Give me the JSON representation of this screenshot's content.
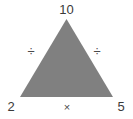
{
  "diagram": {
    "type": "number-triangle-puzzle",
    "shape": {
      "name": "triangle",
      "fill_color": "#808080",
      "apex": {
        "x": 66.5,
        "y": 19
      },
      "bottom_left": {
        "x": 20,
        "y": 97
      },
      "bottom_right": {
        "x": 113,
        "y": 97
      }
    },
    "background_color": "#ffffff",
    "text_color": "#3a3a3a",
    "vertices": [
      {
        "position": "top",
        "value": "10"
      },
      {
        "position": "bottom-left",
        "value": "2"
      },
      {
        "position": "bottom-right",
        "value": "5"
      }
    ],
    "operators": [
      {
        "position": "left-side",
        "symbol": "÷",
        "name": "division-sign"
      },
      {
        "position": "right-side",
        "symbol": "÷",
        "name": "division-sign"
      },
      {
        "position": "bottom-side",
        "symbol": "×",
        "name": "multiplication-sign"
      }
    ]
  }
}
